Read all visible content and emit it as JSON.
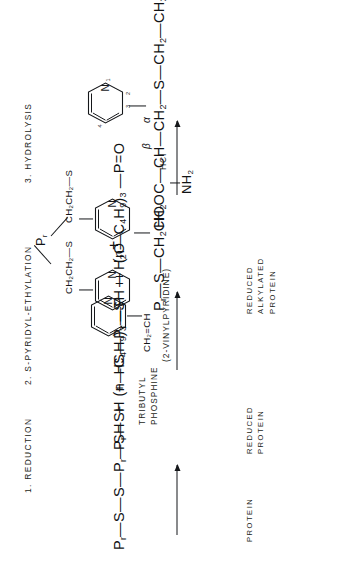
{
  "figure": {
    "type": "chemical-reaction-scheme",
    "orientation": "rotated-90-ccw"
  },
  "steps": [
    {
      "id": "step-1",
      "label": "1. REDUCTION"
    },
    {
      "id": "step-2",
      "label": "2. S-PYRIDYL-ETHYLATION"
    },
    {
      "id": "step-3",
      "label": "3. HYDROLYSIS"
    }
  ],
  "equations": {
    "reactants_line": {
      "protein_disulfide": "P",
      "protein_disulfide_sub1": "r",
      "rest1": "—S—S—",
      "protein2": "P",
      "protein2_sub": "r",
      "rest2": "—SH  +  (n—C",
      "c_sub": "4",
      "h": "H",
      "h_sub": "9",
      "close": ")",
      "close_sub": "3",
      "tail": " —P  +  H",
      "tail_sub": "2",
      "tail_end": "O",
      "full_text": "Pr—S—S—Pr—SH + (n—C4H9)3 —P + H2O"
    },
    "products_line": {
      "full_text": "Pr—SH + HS—Pr—SH + (n—C4H9)3 —P=O"
    },
    "alkylated_line": {
      "full_text": "Pr—S—CH2CH2"
    },
    "hydrolysis_line": {
      "full_text": "HOOC—CH—CH2—S—CH2—CH2"
    },
    "amine_group": "NH",
    "amine_sub": "2"
  },
  "reagents": {
    "tributyl_phosphine_l1": "TRIBUTYL",
    "tributyl_phosphine_l2": "PHOSPHINE",
    "vinyl_group": "CH",
    "vinyl_group_sub": "2",
    "vinyl_group_rest": "=CH",
    "vinylpyridine_name": "(2-VINYLPYRIDINE)",
    "hcl": "HCl"
  },
  "chains": {
    "ethylthio_a": "CH",
    "ethylthio_a_sub": "2",
    "ethylthio_b": "CH",
    "ethylthio_b_sub": "2",
    "ethylthio_tail": "—S",
    "ethylthio_full": "CH2CH2—S",
    "branch_atom": "P",
    "branch_atom_sub": "r",
    "ring_methylene": "CH",
    "ring_methylene_sub": "2"
  },
  "bottom_labels": [
    {
      "id": "label-protein",
      "lines": [
        "PROTEIN"
      ]
    },
    {
      "id": "label-reduced-protein",
      "lines": [
        "REDUCED",
        "PROTEIN"
      ]
    },
    {
      "id": "label-reduced-alkylated-protein",
      "lines": [
        "REDUCED",
        "ALKYLATED",
        "PROTEIN"
      ]
    }
  ],
  "locants": {
    "beta": "β",
    "alpha": "α",
    "ring_numbers": [
      "1",
      "2",
      "3",
      "4"
    ]
  },
  "symbols": {
    "plus": "+",
    "nitrogen": "N"
  },
  "colors": {
    "ink": "#15171a",
    "paper": "#ffffff"
  }
}
